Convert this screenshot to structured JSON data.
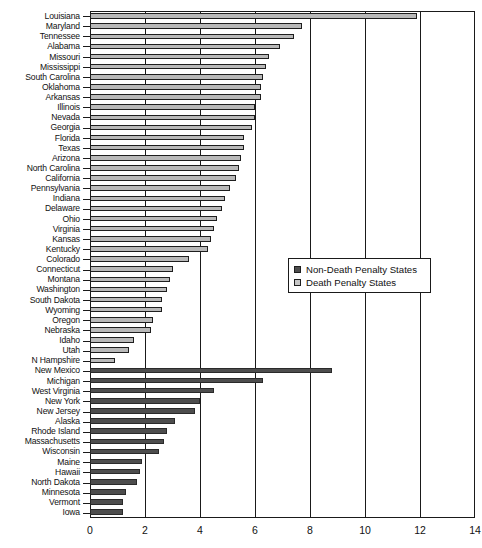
{
  "chart_data": {
    "type": "bar",
    "orientation": "horizontal",
    "title": "",
    "xlabel": "",
    "ylabel": "",
    "xlim": [
      0,
      14
    ],
    "xticks": [
      0,
      2,
      4,
      6,
      8,
      10,
      12,
      14
    ],
    "xticklabels": [
      "0",
      "2",
      "4",
      "6",
      "8",
      "10",
      "12",
      "14"
    ],
    "grid": true,
    "grid_axis": "x",
    "legend_position": "center-right",
    "colors": {
      "death_penalty_states": "#b9b9b9",
      "non_death_penalty_states": "#4d4d4d",
      "axis": "#1a1a1a",
      "background": "#ffffff"
    },
    "legend": [
      {
        "label": "Non-Death Penalty States",
        "swatch": "ndp"
      },
      {
        "label": "Death Penalty States",
        "swatch": "dp"
      }
    ],
    "series": [
      {
        "name": "Death Penalty States",
        "group": "dp",
        "categories": [
          "Louisiana",
          "Maryland",
          "Tennessee",
          "Alabama",
          "Missouri",
          "Mississippi",
          "South Carolina",
          "Oklahoma",
          "Arkansas",
          "Illinois",
          "Nevada",
          "Georgia",
          "Florida",
          "Texas",
          "Arizona",
          "North Carolina",
          "California",
          "Pennsylvania",
          "Indiana",
          "Delaware",
          "Ohio",
          "Virginia",
          "Kansas",
          "Kentucky",
          "Colorado",
          "Connecticut",
          "Montana",
          "Washington",
          "South Dakota",
          "Wyoming",
          "Oregon",
          "Nebraska",
          "Idaho",
          "Utah",
          "N Hampshire"
        ],
        "values": [
          11.9,
          7.7,
          7.4,
          6.9,
          6.5,
          6.4,
          6.3,
          6.2,
          6.2,
          6.0,
          6.0,
          5.9,
          5.6,
          5.6,
          5.5,
          5.4,
          5.3,
          5.1,
          4.9,
          4.8,
          4.6,
          4.5,
          4.4,
          4.3,
          3.6,
          3.0,
          2.9,
          2.8,
          2.6,
          2.6,
          2.3,
          2.2,
          1.6,
          1.4,
          0.9
        ]
      },
      {
        "name": "Non-Death Penalty States",
        "group": "ndp",
        "categories": [
          "New Mexico",
          "Michigan",
          "West Virginia",
          "New York",
          "New Jersey",
          "Alaska",
          "Rhode Island",
          "Massachusetts",
          "Wisconsin",
          "Maine",
          "Hawaii",
          "North Dakota",
          "Minnesota",
          "Vermont",
          "Iowa"
        ],
        "values": [
          8.8,
          6.3,
          4.5,
          4.0,
          3.8,
          3.1,
          2.8,
          2.7,
          2.5,
          1.9,
          1.8,
          1.7,
          1.3,
          1.2,
          1.2
        ]
      }
    ],
    "all_rows": [
      {
        "label": "Louisiana",
        "value": 11.9,
        "group": "dp"
      },
      {
        "label": "Maryland",
        "value": 7.7,
        "group": "dp"
      },
      {
        "label": "Tennessee",
        "value": 7.4,
        "group": "dp"
      },
      {
        "label": "Alabama",
        "value": 6.9,
        "group": "dp"
      },
      {
        "label": "Missouri",
        "value": 6.5,
        "group": "dp"
      },
      {
        "label": "Mississippi",
        "value": 6.4,
        "group": "dp"
      },
      {
        "label": "South Carolina",
        "value": 6.3,
        "group": "dp"
      },
      {
        "label": "Oklahoma",
        "value": 6.2,
        "group": "dp"
      },
      {
        "label": "Arkansas",
        "value": 6.2,
        "group": "dp"
      },
      {
        "label": "Illinois",
        "value": 6.0,
        "group": "dp"
      },
      {
        "label": "Nevada",
        "value": 6.0,
        "group": "dp"
      },
      {
        "label": "Georgia",
        "value": 5.9,
        "group": "dp"
      },
      {
        "label": "Florida",
        "value": 5.6,
        "group": "dp"
      },
      {
        "label": "Texas",
        "value": 5.6,
        "group": "dp"
      },
      {
        "label": "Arizona",
        "value": 5.5,
        "group": "dp"
      },
      {
        "label": "North Carolina",
        "value": 5.4,
        "group": "dp"
      },
      {
        "label": "California",
        "value": 5.3,
        "group": "dp"
      },
      {
        "label": "Pennsylvania",
        "value": 5.1,
        "group": "dp"
      },
      {
        "label": "Indiana",
        "value": 4.9,
        "group": "dp"
      },
      {
        "label": "Delaware",
        "value": 4.8,
        "group": "dp"
      },
      {
        "label": "Ohio",
        "value": 4.6,
        "group": "dp"
      },
      {
        "label": "Virginia",
        "value": 4.5,
        "group": "dp"
      },
      {
        "label": "Kansas",
        "value": 4.4,
        "group": "dp"
      },
      {
        "label": "Kentucky",
        "value": 4.3,
        "group": "dp"
      },
      {
        "label": "Colorado",
        "value": 3.6,
        "group": "dp"
      },
      {
        "label": "Connecticut",
        "value": 3.0,
        "group": "dp"
      },
      {
        "label": "Montana",
        "value": 2.9,
        "group": "dp"
      },
      {
        "label": "Washington",
        "value": 2.8,
        "group": "dp"
      },
      {
        "label": "South Dakota",
        "value": 2.6,
        "group": "dp"
      },
      {
        "label": "Wyoming",
        "value": 2.6,
        "group": "dp"
      },
      {
        "label": "Oregon",
        "value": 2.3,
        "group": "dp"
      },
      {
        "label": "Nebraska",
        "value": 2.2,
        "group": "dp"
      },
      {
        "label": "Idaho",
        "value": 1.6,
        "group": "dp"
      },
      {
        "label": "Utah",
        "value": 1.4,
        "group": "dp"
      },
      {
        "label": "N Hampshire",
        "value": 0.9,
        "group": "dp"
      },
      {
        "label": "New Mexico",
        "value": 8.8,
        "group": "ndp"
      },
      {
        "label": "Michigan",
        "value": 6.3,
        "group": "ndp"
      },
      {
        "label": "West Virginia",
        "value": 4.5,
        "group": "ndp"
      },
      {
        "label": "New York",
        "value": 4.0,
        "group": "ndp"
      },
      {
        "label": "New Jersey",
        "value": 3.8,
        "group": "ndp"
      },
      {
        "label": "Alaska",
        "value": 3.1,
        "group": "ndp"
      },
      {
        "label": "Rhode Island",
        "value": 2.8,
        "group": "ndp"
      },
      {
        "label": "Massachusetts",
        "value": 2.7,
        "group": "ndp"
      },
      {
        "label": "Wisconsin",
        "value": 2.5,
        "group": "ndp"
      },
      {
        "label": "Maine",
        "value": 1.9,
        "group": "ndp"
      },
      {
        "label": "Hawaii",
        "value": 1.8,
        "group": "ndp"
      },
      {
        "label": "North Dakota",
        "value": 1.7,
        "group": "ndp"
      },
      {
        "label": "Minnesota",
        "value": 1.3,
        "group": "ndp"
      },
      {
        "label": "Vermont",
        "value": 1.2,
        "group": "ndp"
      },
      {
        "label": "Iowa",
        "value": 1.2,
        "group": "ndp"
      }
    ]
  }
}
